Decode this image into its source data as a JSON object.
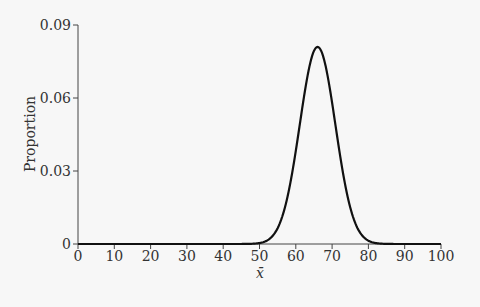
{
  "chart_data": {
    "type": "line",
    "title": "",
    "xlabel": "x̄",
    "ylabel": "Proportion",
    "xlim": [
      0,
      100
    ],
    "ylim": [
      0,
      0.09
    ],
    "xticks": [
      0,
      10,
      20,
      30,
      40,
      50,
      60,
      70,
      80,
      90,
      100
    ],
    "yticks": [
      0,
      0.03,
      0.06,
      0.09
    ],
    "ytick_labels": [
      "0",
      "0.03",
      "0.06",
      "0.09"
    ],
    "grid": false,
    "legend": null,
    "series": [
      {
        "name": "sampling distribution of x̄",
        "distribution": "normal",
        "mean": 66,
        "sd": 4.9,
        "peak": 0.081,
        "x": [
          0,
          50,
          52,
          54,
          56,
          58,
          60,
          62,
          64,
          66,
          68,
          70,
          72,
          74,
          76,
          78,
          80,
          82,
          100
        ],
        "y": [
          0,
          0.0004,
          0.0013,
          0.004,
          0.0101,
          0.0214,
          0.0383,
          0.0584,
          0.0748,
          0.0814,
          0.0748,
          0.0584,
          0.0383,
          0.0214,
          0.0101,
          0.004,
          0.0013,
          0.0004,
          0
        ]
      }
    ]
  }
}
